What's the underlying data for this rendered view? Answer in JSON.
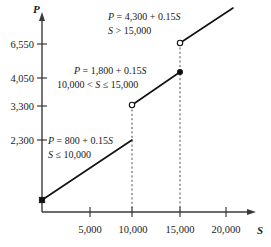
{
  "chart_data": {
    "type": "line",
    "title": "",
    "xlabel": "S",
    "ylabel": "P",
    "xlim": [
      0,
      23000
    ],
    "ylim": [
      0,
      7600
    ],
    "grid": false,
    "legend": "none",
    "xticks": [
      "5,000",
      "10,000",
      "15,000",
      "20,000"
    ],
    "xtick_values": [
      5000,
      10000,
      15000,
      20000
    ],
    "yticks": [
      "2,300",
      "3,300",
      "4,050",
      "6,550"
    ],
    "ytick_values": [
      2300,
      3300,
      4050,
      6550
    ],
    "series": [
      {
        "name": "segment-1",
        "equation": "P = 800 + 0.15S",
        "domain": "S ≤ 10,000",
        "x": [
          0,
          10000
        ],
        "values": [
          800,
          2300
        ],
        "start_marker": "closed",
        "end_marker": "none"
      },
      {
        "name": "segment-2",
        "equation": "P = 1,800 + 0.15S",
        "domain": "10,000 < S ≤ 15,000",
        "x": [
          10000,
          15000
        ],
        "values": [
          3300,
          4050
        ],
        "start_marker": "open",
        "end_marker": "closed"
      },
      {
        "name": "segment-3",
        "equation": "P = 4,300 + 0.15S",
        "domain": "S > 15,000",
        "x": [
          15000,
          21500
        ],
        "values": [
          6550,
          7530
        ],
        "start_marker": "open",
        "end_marker": "none"
      }
    ],
    "annotations": [
      {
        "name": "annotation-upper",
        "line1": "P = 4,300 + 0.15S",
        "line2": "S  > 15,000"
      },
      {
        "name": "annotation-middle",
        "line1": "P = 1,800 + 0.15S",
        "line2": "10,000 < S ≤ 15,000"
      },
      {
        "name": "annotation-lower",
        "line1": "P = 800 + 0.15S",
        "line2": "S ≤ 10,000"
      }
    ],
    "dropped_verticals": [
      10000,
      15000
    ],
    "colors": {
      "line": "#111111",
      "axis": "#3a3a3a",
      "dashed": "#4a4a4a",
      "text": "#1a1a1a",
      "background": "#ffffff"
    }
  },
  "labels": {
    "p_axis": "P",
    "s_axis": "S",
    "y1": "6,550",
    "y2": "4,050",
    "y3": "3,300",
    "y4": "2,300",
    "x1": "5,000",
    "x2": "10,000",
    "x3": "15,000",
    "x4": "20,000",
    "eq_top_l1": "P = 4,300 + 0.15S",
    "eq_top_l2": "S  > 15,000",
    "eq_mid_l1": "P = 1,800 + 0.15S",
    "eq_mid_l2": "10,000 < S ≤ 15,000",
    "eq_low_l1": "P = 800 + 0.15S",
    "eq_low_l2": "S ≤ 10,000"
  }
}
